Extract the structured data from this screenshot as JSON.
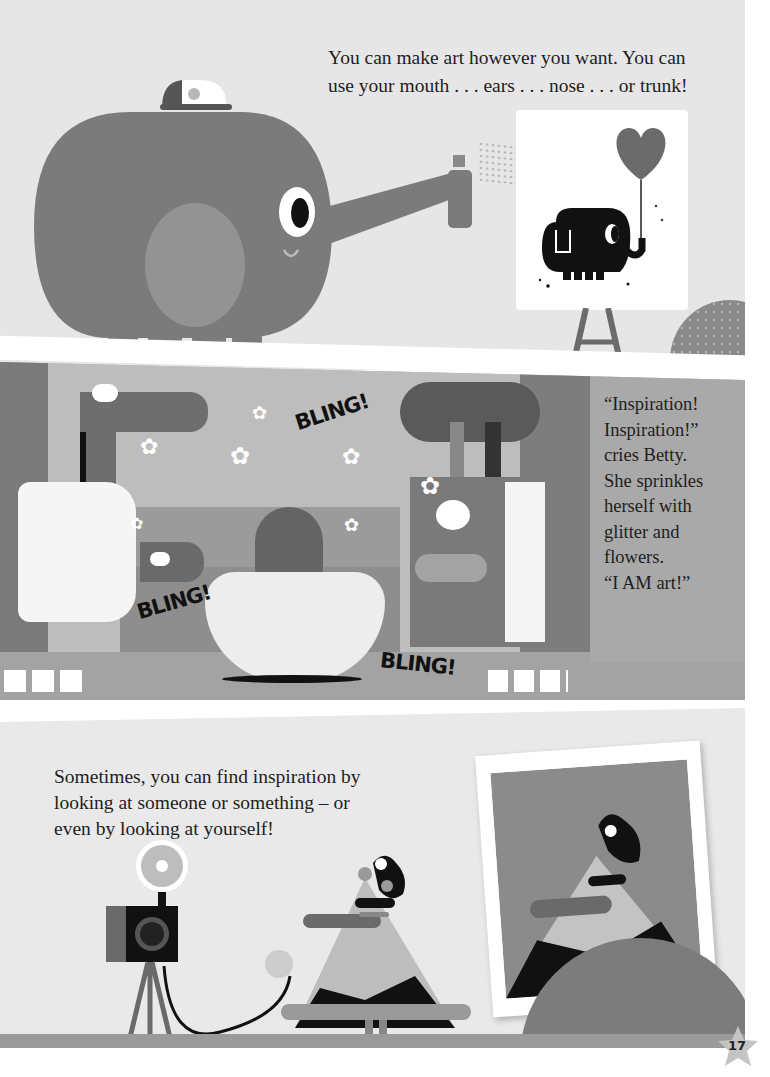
{
  "page": {
    "number": "17",
    "colors": {
      "page_bg": "#ffffff",
      "panel1_bg": "#e6e6e6",
      "panel2_bg": "#a9a9a9",
      "panel3_bg": "#e9e9e9",
      "elephant": "#7b7b7b",
      "elephant_ear": "#939393",
      "text": "#1e1e1e",
      "black": "#111111"
    }
  },
  "panel_top": {
    "caption_lines": [
      "You can make art however you want. You can",
      "use your mouth . . . ears . . . nose . . . or trunk!"
    ],
    "illustration": {
      "character": "elephant with cap spraying paint from trunk",
      "canvas": "easel canvas with black elephant holding heart balloon"
    }
  },
  "panel_middle": {
    "caption_lines": [
      "“Inspiration!",
      "Inspiration!”",
      "cries Betty.",
      "She sprinkles",
      "herself with",
      "glitter and",
      "flowers.",
      "“I AM art!”"
    ],
    "sound_effects": [
      "BLING!",
      "BLING!",
      "BLING!"
    ],
    "illustration": {
      "scene": "stage with curtains, characters posing with flowers"
    }
  },
  "panel_bottom": {
    "caption_lines": [
      "Sometimes, you can find inspiration by",
      "looking at someone or something – or",
      "even by looking at yourself!"
    ],
    "illustration": {
      "scene": "character taking self-portrait with camera on tripod",
      "photo": "framed photograph of the character"
    }
  }
}
